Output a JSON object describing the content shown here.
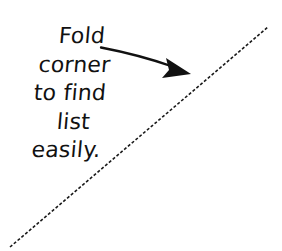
{
  "canvas": {
    "width": 282,
    "height": 251,
    "background_color": "#ffffff",
    "ink_color": "#111111"
  },
  "annotation": {
    "note": {
      "full_text": "Fold corner to find list easily.",
      "lines": [
        "Fold",
        "corner",
        "to find",
        "list",
        "easily."
      ],
      "style": "handwritten",
      "align": "center",
      "color": "#111111"
    },
    "arrow": {
      "icon": "arrow-right-down-icon",
      "label": "points from note text toward folded corner",
      "tail": {
        "x": 101,
        "y": 48
      },
      "tip": {
        "x": 191,
        "y": 74
      },
      "head_style": "solid-triangle",
      "color": "#111111",
      "stroke_width": 2.2
    },
    "fold_line": {
      "icon": "dashed-diagonal-fold-line-icon",
      "label": "dashed fold guide line",
      "start": {
        "x": 10,
        "y": 247
      },
      "end": {
        "x": 268,
        "y": 27
      },
      "dash": "3 2",
      "color": "#1a1a1a",
      "stroke_width": 1.6
    }
  }
}
